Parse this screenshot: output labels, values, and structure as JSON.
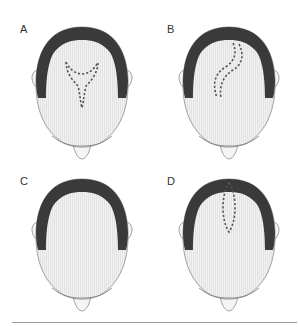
{
  "figure": {
    "panels": [
      {
        "label": "A",
        "incision": "y-shaped",
        "position": "top-left"
      },
      {
        "label": "B",
        "incision": "s-shaped",
        "position": "top-right"
      },
      {
        "label": "C",
        "incision": "none",
        "position": "bottom-left"
      },
      {
        "label": "D",
        "incision": "elliptical",
        "position": "bottom-right"
      }
    ],
    "colors": {
      "hair": "#3a3a3a",
      "scalp": "#ececec",
      "outline": "#8a8a8a",
      "incision": "#555555",
      "rule": "#9a9a9a"
    }
  }
}
